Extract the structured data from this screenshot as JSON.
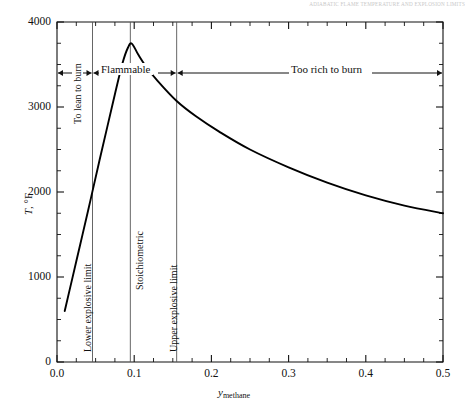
{
  "page": {
    "running_header": "ADIABATIC FLAME TEMPERATURE AND EXPLOSION LIMITS"
  },
  "chart_data": {
    "type": "line",
    "title": "",
    "xlabel": "y_methane",
    "xlabel_base": "y",
    "xlabel_sub": "methane",
    "ylabel": "T, °F",
    "ylabel_var": "T",
    "ylabel_unit": ", °F",
    "xlim": [
      0.0,
      0.5
    ],
    "ylim": [
      0,
      4000
    ],
    "grid": false,
    "legend": "none",
    "xticks": [
      "0.0",
      "0.1",
      "0.2",
      "0.3",
      "0.4",
      "0.5"
    ],
    "xtick_values": [
      0.0,
      0.1,
      0.2,
      0.3,
      0.4,
      0.5
    ],
    "xminor_step": 0.025,
    "yticks": [
      "0",
      "1000",
      "2000",
      "3000",
      "4000"
    ],
    "ytick_values": [
      0,
      1000,
      2000,
      3000,
      4000
    ],
    "yminor_step": 250,
    "series": [
      {
        "name": "Adiabatic flame temperature",
        "x": [
          0.01,
          0.02,
          0.03,
          0.04,
          0.046,
          0.055,
          0.065,
          0.075,
          0.085,
          0.092,
          0.097,
          0.105,
          0.115,
          0.13,
          0.155,
          0.18,
          0.21,
          0.25,
          0.3,
          0.35,
          0.4,
          0.45,
          0.5
        ],
        "y": [
          600,
          990,
          1380,
          1770,
          2010,
          2370,
          2760,
          3150,
          3520,
          3700,
          3745,
          3620,
          3480,
          3310,
          3070,
          2890,
          2710,
          2500,
          2290,
          2110,
          1960,
          1840,
          1750
        ]
      }
    ],
    "vertical_lines": [
      {
        "label": "Lower explosive limit",
        "x": 0.046
      },
      {
        "label": "Stoichiometric",
        "x": 0.095
      },
      {
        "label": "Upper explosive limit",
        "x": 0.155
      }
    ],
    "regions": [
      {
        "label": "To lean to burn",
        "orientation": "vertical",
        "x_center": 0.028
      },
      {
        "label": "Flammable",
        "orientation": "horizontal",
        "x_from": 0.046,
        "x_to": 0.155
      },
      {
        "label": "Too rich to burn",
        "orientation": "horizontal",
        "x_from": 0.155,
        "x_to": 0.5
      }
    ],
    "annotation_level_y": 3400
  }
}
